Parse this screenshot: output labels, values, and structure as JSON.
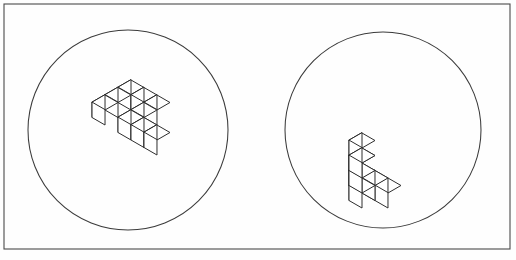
{
  "page": {
    "kind": "mental-rotation-stimulus-pair",
    "background_color": "#ffffff",
    "width": 516,
    "height": 260
  },
  "panel": {
    "label": "outer-frame",
    "x": 4,
    "y": 4,
    "width": 506,
    "height": 245,
    "stroke_color": "#4a4a4a",
    "fill_color": "#fefefe"
  },
  "circles": [
    {
      "name": "left-stimulus-circle",
      "cx": 128,
      "cy": 130,
      "r": 100,
      "stroke_color": "#3b3b3b"
    },
    {
      "name": "right-stimulus-circle",
      "cx": 383,
      "cy": 130,
      "r": 98,
      "stroke_color": "#3b3b3b"
    }
  ],
  "figures": [
    {
      "name": "left-cube-figure",
      "circle": "left-stimulus-circle",
      "description": "Isometric block assembly of unit cubes viewed from above-left; an L-shaped slab with an arm extending to the right.",
      "origin_x": 131,
      "origin_y": 95,
      "cube_size": 15.0,
      "orientation": "top-left-view",
      "face_colors": {
        "top": "#ffffff",
        "left": "#ffffff",
        "right": "#ffffff"
      },
      "cubes": [
        {
          "x": 0,
          "y": 0,
          "z": 0
        },
        {
          "x": 1,
          "y": 0,
          "z": 0
        },
        {
          "x": 2,
          "y": 0,
          "z": 0
        },
        {
          "x": 0,
          "y": 1,
          "z": 0
        },
        {
          "x": 0,
          "y": 2,
          "z": 0
        },
        {
          "x": 2,
          "y": 1,
          "z": 0
        },
        {
          "x": 2,
          "y": 2,
          "z": 0
        },
        {
          "x": 3,
          "y": 2,
          "z": 0
        },
        {
          "x": 4,
          "y": 2,
          "z": 0
        }
      ],
      "cube_count": 9
    },
    {
      "name": "right-cube-figure",
      "circle": "right-stimulus-circle",
      "description": "Isometric block assembly of unit cubes viewed from below-right; a stepped stack with a vertical column rising at the back.",
      "origin_x": 362,
      "origin_y": 178,
      "cube_size": 15.0,
      "orientation": "front-right-view",
      "face_colors": {
        "top": "#ffffff",
        "left": "#ffffff",
        "right": "#ffffff"
      },
      "cubes": [
        {
          "x": 0,
          "y": 0,
          "z": 0
        },
        {
          "x": 0,
          "y": 0,
          "z": 1
        },
        {
          "x": 0,
          "y": 0,
          "z": 2
        },
        {
          "x": 1,
          "y": 0,
          "z": 0
        },
        {
          "x": 2,
          "y": 0,
          "z": 0
        },
        {
          "x": 2,
          "y": 1,
          "z": 1
        },
        {
          "x": 2,
          "y": 2,
          "z": 1
        },
        {
          "x": 2,
          "y": 2,
          "z": 2
        },
        {
          "x": 2,
          "y": 2,
          "z": 3
        }
      ],
      "cube_count": 9
    }
  ]
}
